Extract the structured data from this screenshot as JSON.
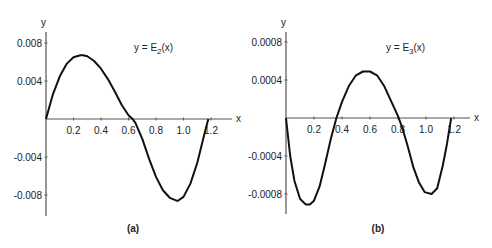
{
  "chart_data": [
    {
      "type": "line",
      "panel_label": "(a)",
      "title": "y = E_2(x)",
      "annotation": {
        "prefix": "y = E",
        "sub": "2",
        "suffix": "(x)"
      },
      "xlabel": "x",
      "ylabel": "y",
      "xticks": [
        "0.2",
        "0.4",
        "0.6",
        "0.8",
        "1.0",
        "1.2"
      ],
      "yticks": [
        "0.008",
        "0.004",
        "-0.004",
        "-0.008"
      ],
      "xlim": [
        0,
        1.25
      ],
      "ylim": [
        -0.0095,
        0.0095
      ],
      "grid": false,
      "series": [
        {
          "name": "E2(x)",
          "x": [
            0,
            0.05,
            0.1,
            0.15,
            0.2,
            0.25,
            0.27,
            0.3,
            0.35,
            0.4,
            0.45,
            0.5,
            0.55,
            0.6,
            0.63,
            0.65,
            0.7,
            0.75,
            0.8,
            0.85,
            0.9,
            0.95,
            0.96,
            1.0,
            1.05,
            1.1,
            1.15,
            1.18
          ],
          "y": [
            0,
            0.0026,
            0.0045,
            0.0058,
            0.0065,
            0.0067,
            0.0067,
            0.0066,
            0.0061,
            0.0053,
            0.0042,
            0.0029,
            0.0015,
            0.0004,
            0,
            -0.0004,
            -0.0021,
            -0.0042,
            -0.0061,
            -0.0075,
            -0.0083,
            -0.0086,
            -0.0086,
            -0.0082,
            -0.0068,
            -0.0046,
            -0.0017,
            0
          ]
        }
      ]
    },
    {
      "type": "line",
      "panel_label": "(b)",
      "title": "y = E_3(x)",
      "annotation": {
        "prefix": "y = E",
        "sub": "3",
        "suffix": "(x)"
      },
      "xlabel": "x",
      "ylabel": "y",
      "xticks": [
        "0.2",
        "0.4",
        "0.6",
        "0.8",
        "1.0",
        "1.2"
      ],
      "yticks": [
        "0.0008",
        "0.0004",
        "-0.0004",
        "-0.0008"
      ],
      "xlim": [
        0,
        1.25
      ],
      "ylim": [
        -0.00095,
        0.00095
      ],
      "grid": false,
      "series": [
        {
          "name": "E3(x)",
          "x": [
            0,
            0.03,
            0.06,
            0.1,
            0.14,
            0.17,
            0.2,
            0.24,
            0.28,
            0.32,
            0.36,
            0.4,
            0.45,
            0.5,
            0.55,
            0.6,
            0.65,
            0.7,
            0.75,
            0.8,
            0.83,
            0.87,
            0.91,
            0.95,
            0.99,
            1.04,
            1.08,
            1.12,
            1.15,
            1.18
          ],
          "y": [
            0,
            -0.0004,
            -0.00066,
            -0.00085,
            -0.00091,
            -0.00091,
            -0.00087,
            -0.00072,
            -0.00048,
            -0.00022,
            0,
            0.00017,
            0.00034,
            0.00045,
            0.00049,
            0.00049,
            0.00045,
            0.00034,
            0.00018,
            2e-05,
            -0.0001,
            -0.0003,
            -0.00052,
            -0.00068,
            -0.00078,
            -0.0008,
            -0.00074,
            -0.0005,
            -0.00027,
            0
          ]
        }
      ]
    }
  ]
}
